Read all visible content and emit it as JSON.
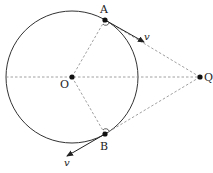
{
  "diagram": {
    "colors": {
      "stroke": "#333333",
      "dashed": "#888888",
      "point": "#111111",
      "background": "#ffffff"
    },
    "circle": {
      "cx": 72,
      "cy": 77,
      "r": 66
    },
    "points": {
      "O": {
        "label": "O",
        "x": 72,
        "y": 77
      },
      "A": {
        "label": "A",
        "x": 105,
        "y": 20
      },
      "B": {
        "label": "B",
        "x": 105,
        "y": 134
      },
      "Q": {
        "label": "Q",
        "x": 200,
        "y": 77
      }
    },
    "vectors": [
      {
        "from": "A",
        "label": "v",
        "x2": 144,
        "y2": 42
      },
      {
        "from": "B",
        "label": "v",
        "x2": 67,
        "y2": 156
      }
    ],
    "dashed_lines": [
      "diameter through O to Q",
      "O to A",
      "O to B",
      "A to Q",
      "B to Q"
    ],
    "right_angle_marks": [
      "A",
      "B"
    ]
  }
}
